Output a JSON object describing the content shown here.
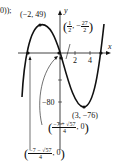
{
  "prefix": "0));",
  "axes": {
    "x_label": "x",
    "y_label": "y",
    "x_ticks": [
      "2",
      "4"
    ],
    "y_tick": "−80"
  },
  "points": {
    "max": "(−2, 49)",
    "min": "(3, −76)",
    "y_intercept": {
      "open": "(",
      "num": "1",
      "den": "2",
      "sep": ", −",
      "num2": "27",
      "den2": "2",
      "close": ")"
    },
    "root_plus": {
      "open": "(",
      "num": "−7 + √57",
      "den": "4",
      "tail": ", 0",
      "close": ")"
    },
    "root_minus": {
      "open": "(",
      "num": "−7 − √57",
      "den": "4",
      "tail": ", 0",
      "close": ")"
    }
  },
  "colors": {
    "curve": "#111111",
    "axis": "#111111"
  }
}
